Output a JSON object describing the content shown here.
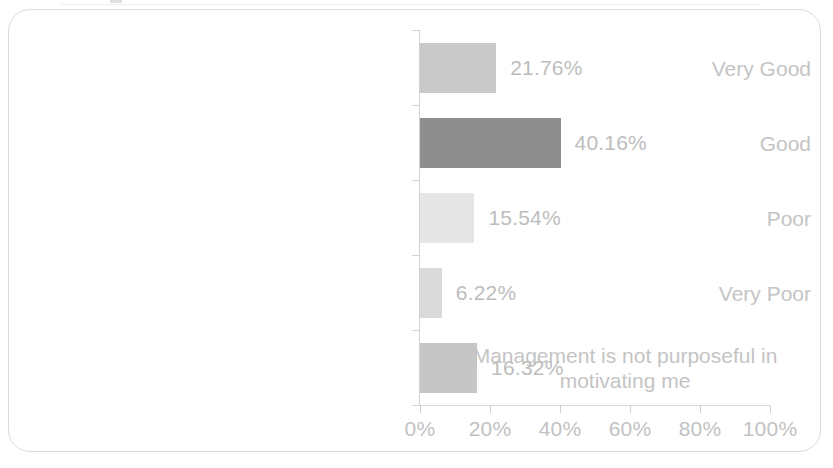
{
  "chart_data": {
    "type": "bar",
    "orientation": "horizontal",
    "title": "",
    "subtitle": "",
    "xlabel": "",
    "ylabel": "",
    "xlim": [
      0,
      100
    ],
    "grid": false,
    "legend": false,
    "categories": [
      "Very Good",
      "Good",
      "Poor",
      "Very Poor",
      "Management is not purposeful in\nmotivating me"
    ],
    "values": [
      21.76,
      40.16,
      15.54,
      6.22,
      16.32
    ],
    "data_labels": [
      "21.76%",
      "40.16%",
      "15.54%",
      "6.22%",
      "16.32%"
    ],
    "bar_colors": [
      "#c9c9c9",
      "#8e8e8e",
      "#e6e6e6",
      "#dadada",
      "#c6c6c6"
    ],
    "x_ticks": [
      0,
      20,
      40,
      60,
      80,
      100
    ],
    "x_tick_labels": [
      "0%",
      "20%",
      "40%",
      "60%",
      "80%",
      "100%"
    ],
    "axis_color": "#d2d2d4",
    "text_color": "#c2c2c2"
  },
  "frame": {
    "border_color": "#dcdcdf",
    "background": "#ffffff"
  }
}
